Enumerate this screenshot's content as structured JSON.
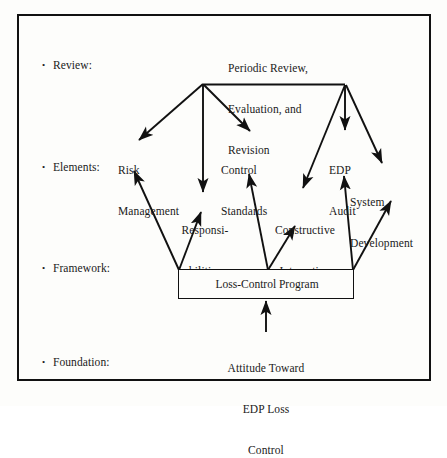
{
  "figure": {
    "frame_color": "#111111",
    "background": "#fdfdfb"
  },
  "tiers": [
    {
      "id": "review",
      "bullet": "•",
      "label": "Review:"
    },
    {
      "id": "elements",
      "bullet": "•",
      "label": "Elements:"
    },
    {
      "id": "framework",
      "bullet": "•",
      "label": "Framework:"
    },
    {
      "id": "foundation",
      "bullet": "•",
      "label": "Foundation:"
    }
  ],
  "nodes": {
    "review": {
      "line1": "Periodic Review,",
      "line2": "Evaluation, and",
      "line3": "Revision"
    },
    "risk_management": {
      "line1": "Risk",
      "line2": "Management"
    },
    "control_standards": {
      "line1": "Control",
      "line2": "Standards"
    },
    "edp_audit": {
      "line1": "EDP",
      "line2": "Audit"
    },
    "system_development": {
      "line1": "System",
      "line2": "Development"
    },
    "responsibilities": {
      "line1": "Responsi-",
      "line2": "bilities"
    },
    "constructive_interaction": {
      "line1": "Constructive",
      "line2": "Interaction"
    },
    "loss_control_program": {
      "label": "Loss-Control Program"
    },
    "attitude": {
      "line1": "Attitude Toward",
      "line2": "EDP Loss",
      "line3": "Control"
    }
  }
}
